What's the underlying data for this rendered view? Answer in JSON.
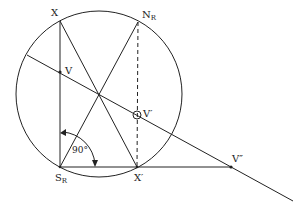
{
  "diagram": {
    "circle": {
      "cx": 99,
      "cy": 94,
      "r": 83
    },
    "points": {
      "X": {
        "label": "X",
        "x": 60,
        "y": 21
      },
      "NR": {
        "label": "N",
        "sub": "R",
        "x": 138,
        "y": 22
      },
      "SR": {
        "label": "S",
        "sub": "R",
        "x": 60,
        "y": 167
      },
      "Xp": {
        "label": "X′",
        "x": 137,
        "y": 167
      },
      "V": {
        "label": "V",
        "x": 60,
        "y": 72
      },
      "Vp": {
        "label": "V′",
        "x": 137,
        "y": 115
      },
      "Vpp": {
        "label": "V″",
        "x": 231,
        "y": 167
      }
    },
    "angle_label": "90°",
    "colors": {
      "stroke": "#222222",
      "background": "#ffffff"
    }
  }
}
